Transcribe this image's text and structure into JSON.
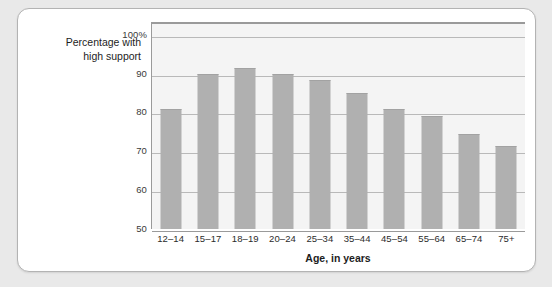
{
  "chart_data": {
    "type": "bar",
    "title": "",
    "xlabel": "Age, in years",
    "ylabel": "Percentage with high support",
    "categories": [
      "12–14",
      "15–17",
      "18–19",
      "20–24",
      "25–34",
      "35–44",
      "45–54",
      "55–64",
      "65–74",
      "75+"
    ],
    "values": [
      81,
      90,
      91.5,
      90,
      88.3,
      85,
      81,
      79,
      74.5,
      71.3
    ],
    "ylim": [
      50,
      103
    ],
    "yticks": [
      50,
      60,
      70,
      80,
      90,
      100
    ],
    "ytick_labels": [
      "50",
      "60",
      "70",
      "80",
      "90",
      "100%"
    ],
    "grid": true,
    "legend": "none",
    "bar_color": "#b0b0b0",
    "plot_background": "#f4f4f4",
    "gridline_color": "#b9b9b9",
    "axis_color": "#9a9a9a"
  },
  "axis": {
    "y_title_line1": "Percentage with",
    "y_title_line2": "high support",
    "x_title": "Age, in years"
  }
}
